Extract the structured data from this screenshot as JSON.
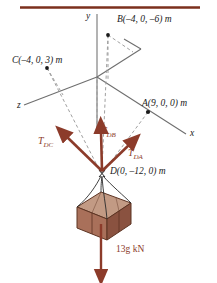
{
  "figure": {
    "title_rule_color": "#7b2f1d",
    "axis_color": "#6e6e6e",
    "dash_color": "#9a9a9a",
    "force_color": "#8c3b2a",
    "crate_colors": {
      "top": "#c29a84",
      "front_left": "#a9705a",
      "front_right": "#8a5240",
      "edge": "#5d3423"
    },
    "axes": [
      {
        "name": "y-axis-label",
        "text": "y",
        "x": 86,
        "y": 12
      },
      {
        "name": "x-axis-label",
        "text": "x",
        "x": 190,
        "y": 129
      },
      {
        "name": "z-axis-label",
        "text": "z",
        "x": 17,
        "y": 101
      }
    ],
    "points": [
      {
        "name": "point-b-label",
        "text": "B(–4, 0, –6) m",
        "x": 117,
        "y": 15
      },
      {
        "name": "point-c-label",
        "text": "C(–4, 0, 3) m",
        "x": 12,
        "y": 56
      },
      {
        "name": "point-a-label",
        "text": "A(9, 0, 0) m",
        "x": 142,
        "y": 99
      },
      {
        "name": "point-d-label",
        "text": "D(0, –12, 0) m",
        "x": 110,
        "y": 167
      }
    ],
    "forces": [
      {
        "name": "force-label-tdc",
        "base": "T",
        "sub": "DC",
        "x": 38,
        "y": 136
      },
      {
        "name": "force-label-tdb",
        "base": "T",
        "sub": "DB",
        "x": 101,
        "y": 126
      },
      {
        "name": "force-label-tda",
        "base": "T",
        "sub": "DA",
        "x": 128,
        "y": 148
      }
    ],
    "weight": {
      "name": "weight-label",
      "text": "13g kN",
      "x": 116,
      "y": 245
    }
  }
}
